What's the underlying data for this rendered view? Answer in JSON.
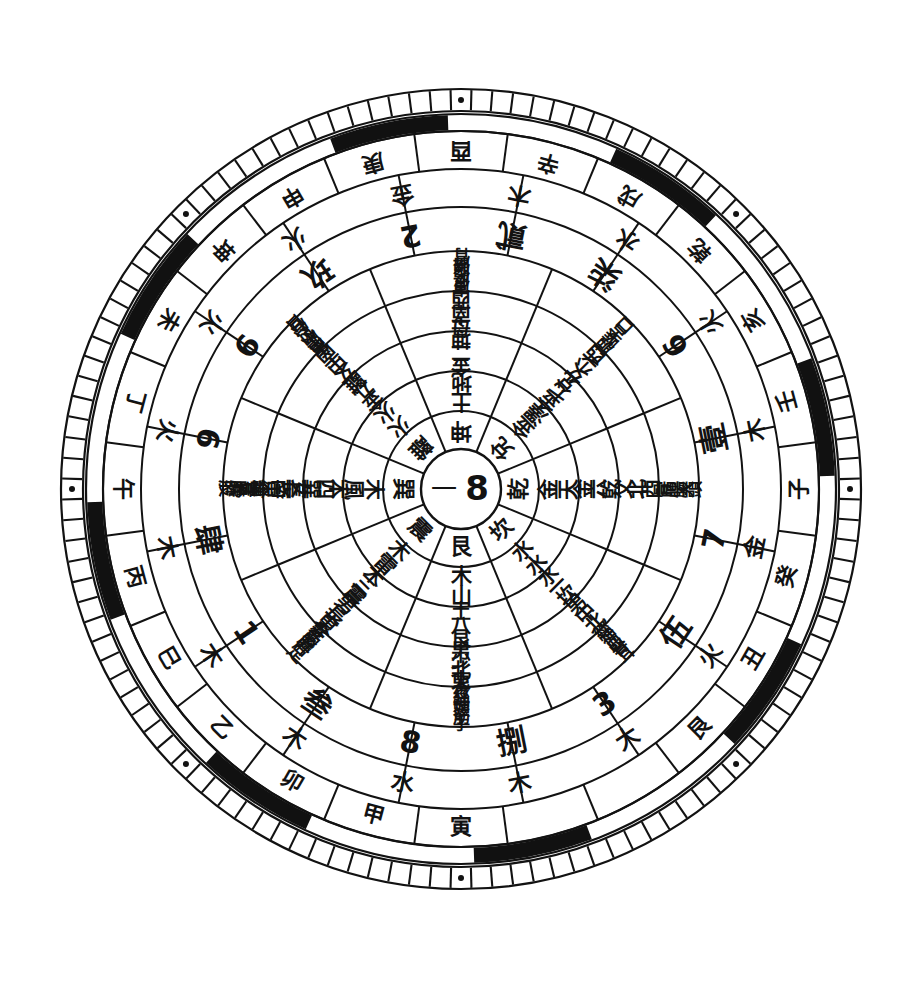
{
  "diagram": {
    "type": "concentric-ring-wheel",
    "center_x": 461,
    "center_y": 489,
    "sectors": 8,
    "colors": {
      "ink": "#121212",
      "paper": "#ffffff",
      "band_dark": "#111111"
    },
    "center": {
      "left_glyph": "一",
      "right_glyph": "8"
    }
  },
  "rings": [
    {
      "id": "r1-trigram",
      "name": "bagua-trigram-names",
      "inner_r": 40,
      "outer_r": 78,
      "font_size": 22,
      "cells": [
        "艮",
        "震",
        "巽",
        "離",
        "坤",
        "兌",
        "乾",
        "坎"
      ]
    },
    {
      "id": "r2-element",
      "name": "trigram-element-pair",
      "inner_r": 78,
      "outer_r": 118,
      "font_size": 21,
      "cells": [
        "山木",
        "雷木",
        "風木",
        "火火",
        "地土",
        "澤金",
        "天金",
        "水水"
      ]
    },
    {
      "id": "r3-number-element",
      "name": "trigram-number-element",
      "inner_r": 118,
      "outer_r": 158,
      "font_size": 20,
      "cells": [
        "艮八土",
        "震三木",
        "巽四木",
        "離九金",
        "坤二金",
        "兌七金",
        "乾六金",
        "坎一水"
      ]
    },
    {
      "id": "r4-direction-family",
      "name": "direction-and-family-role",
      "inner_r": 158,
      "outer_r": 198,
      "font_size": 20,
      "cells": [
        "東北少男",
        "東長男",
        "東南長女",
        "南中女",
        "西南母",
        "西少女",
        "西北父",
        "北中男"
      ]
    },
    {
      "id": "r5-body",
      "name": "body-correspondences",
      "inner_r": 198,
      "outer_r": 238,
      "font_size": 17,
      "cells": [
        "手筋頭神經背",
        "足肝膽筋髮",
        "股肝膽氣管神經",
        "目心心包小腸中焦",
        "胃脾腹皮膚",
        "口舌喉肺",
        "頭大腸肺骨",
        "耳腎血神經"
      ]
    },
    {
      "id": "r6-numeral",
      "name": "numeral-pair-ring",
      "inner_r": 238,
      "outer_r": 282,
      "font_size": 30,
      "cells": [
        "捌",
        "叁",
        "肆",
        "9",
        "2",
        "柒",
        "壹",
        "伍"
      ],
      "cells_alt": [
        "8",
        "1",
        "6",
        "玖",
        "貳",
        "7",
        "7",
        "3"
      ],
      "pairs": [
        [
          "捌",
          "8"
        ],
        [
          "叁",
          "1"
        ],
        [
          "肆",
          "6"
        ],
        [
          "9",
          "玖"
        ],
        [
          "2",
          "貳"
        ],
        [
          "柒",
          "6"
        ],
        [
          "壹",
          "7"
        ],
        [
          "伍",
          "3"
        ]
      ]
    },
    {
      "id": "r7-wuxing",
      "name": "five-element-pair-ring",
      "inner_r": 282,
      "outer_r": 320,
      "font_size": 23,
      "pairs": [
        [
          "木",
          "水"
        ],
        [
          "木",
          "木"
        ],
        [
          "木",
          "火"
        ],
        [
          "火",
          "火"
        ],
        [
          "金",
          "木"
        ],
        [
          "水",
          "火"
        ],
        [
          "木",
          "金"
        ],
        [
          "火",
          "大"
        ]
      ]
    },
    {
      "id": "r8-stems-branches",
      "name": "heavenly-stem-earthly-branch-ring",
      "inner_r": 320,
      "outer_r": 358,
      "font_size": 22,
      "pairs": [
        [
          "寅",
          "甲"
        ],
        [
          "卯",
          "乙"
        ],
        [
          "巳",
          "丙"
        ],
        [
          "午",
          "丁"
        ],
        [
          "未",
          "坤"
        ],
        [
          "申",
          "庚"
        ],
        [
          "酉",
          "辛"
        ],
        [
          "戌",
          "乾"
        ],
        [
          "亥",
          "壬"
        ],
        [
          "子",
          "癸"
        ],
        [
          "丑",
          "艮"
        ]
      ],
      "cells": [
        "艮",
        "寅",
        "甲",
        "卯",
        "乙",
        "丙",
        "午",
        "丁",
        "未",
        "坤",
        "申",
        "庚",
        "酉",
        "辛",
        "戌",
        "乾",
        "亥",
        "壬",
        "子",
        "癸",
        "丑",
        "木",
        "火",
        "金",
        "土",
        "水",
        "大"
      ]
    },
    {
      "id": "r9-band",
      "name": "alternating-black-white-band",
      "inner_r": 358,
      "outer_r": 375,
      "segments": 8
    },
    {
      "id": "r10-ticks",
      "name": "outer-degree-tick-ring",
      "inner_r": 378,
      "outer_r": 400,
      "tick_count": 120,
      "dot_count": 8
    }
  ],
  "legend": {
    "ring_names": [
      "Trigram",
      "Trigram element",
      "Trigram number + element",
      "Direction + family role",
      "Body correspondence",
      "Numeral",
      "Five elements",
      "Stems & branches",
      "Band",
      "Degree ticks"
    ]
  }
}
